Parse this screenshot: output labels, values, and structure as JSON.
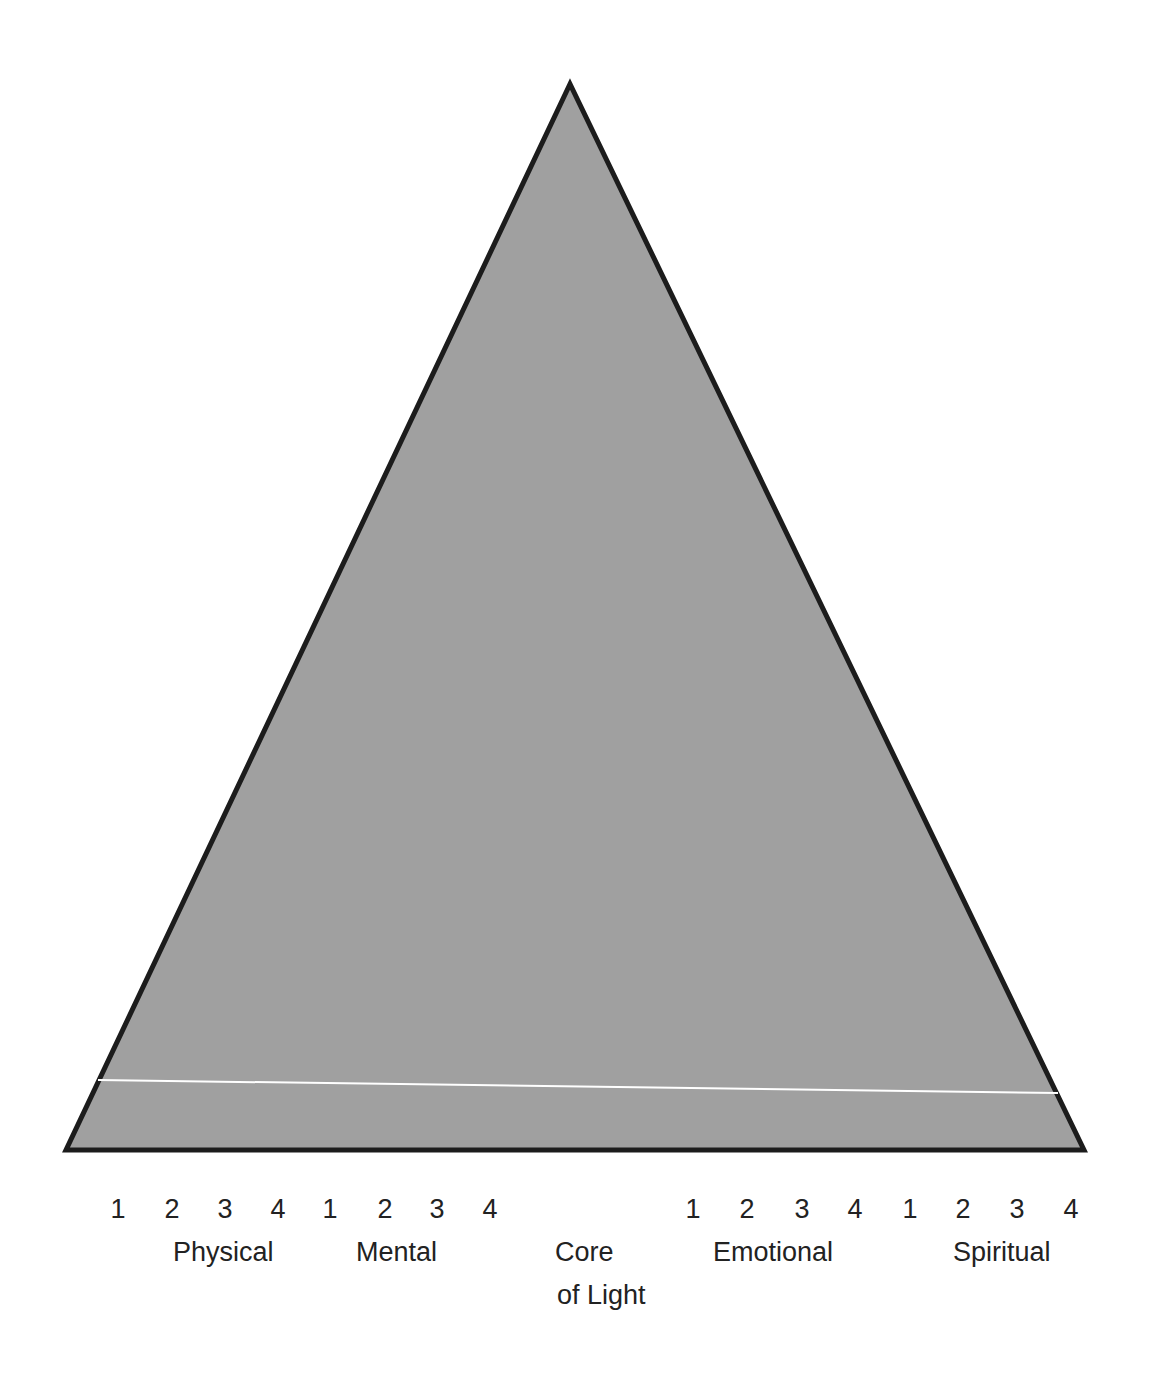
{
  "diagram": {
    "shape": "triangle",
    "colors": {
      "fill": "#a0a0a0",
      "stroke": "#1c1c1c",
      "divider": "#ffffff",
      "text": "#222222"
    },
    "triangle": {
      "apex": [
        570,
        84
      ],
      "bottom_left": [
        66,
        1150
      ],
      "bottom_right": [
        1084,
        1150
      ],
      "stroke_width": 5
    },
    "divider_line": {
      "from": [
        98,
        1080
      ],
      "to": [
        1058,
        1093
      ]
    }
  },
  "scale": {
    "groups": [
      {
        "name": "Physical",
        "digits": [
          {
            "label": "1",
            "x": 118
          },
          {
            "label": "2",
            "x": 172
          },
          {
            "label": "3",
            "x": 225
          },
          {
            "label": "4",
            "x": 278
          }
        ],
        "label_x": 173
      },
      {
        "name": "Mental",
        "digits": [
          {
            "label": "1",
            "x": 330
          },
          {
            "label": "2",
            "x": 385
          },
          {
            "label": "3",
            "x": 437
          },
          {
            "label": "4",
            "x": 490
          }
        ],
        "label_x": 356
      },
      {
        "name": "Emotional",
        "digits": [
          {
            "label": "1",
            "x": 693
          },
          {
            "label": "2",
            "x": 747
          },
          {
            "label": "3",
            "x": 802
          },
          {
            "label": "4",
            "x": 855
          }
        ],
        "label_x": 713
      },
      {
        "name": "Spiritual",
        "digits": [
          {
            "label": "1",
            "x": 910
          },
          {
            "label": "2",
            "x": 963
          },
          {
            "label": "3",
            "x": 1017
          },
          {
            "label": "4",
            "x": 1071
          }
        ],
        "label_x": 953
      }
    ],
    "center_label": {
      "line1": "Core",
      "line2": "of Light"
    }
  }
}
